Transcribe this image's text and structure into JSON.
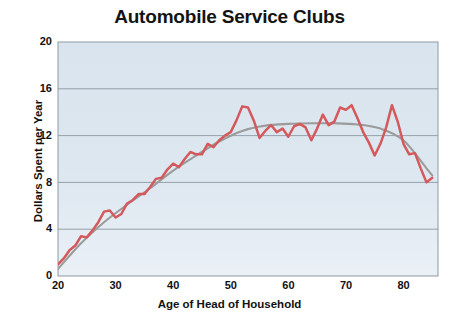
{
  "chart_data": {
    "type": "line",
    "title": "Automobile Service Clubs",
    "xlabel": "Age of Head of Household",
    "ylabel": "Dollars Spent per Year",
    "xlim": [
      20,
      86
    ],
    "ylim": [
      0,
      20
    ],
    "xticks": [
      20,
      30,
      40,
      50,
      60,
      70,
      80
    ],
    "yticks": [
      0,
      4,
      8,
      12,
      16,
      20
    ],
    "grid": true,
    "legend": "none",
    "plot_background_color": "#dce6ef",
    "series": [
      {
        "name": "Dollars spent per year (observed)",
        "color": "#d4595c",
        "style": "jagged-line",
        "x": [
          20,
          21,
          22,
          23,
          24,
          25,
          26,
          27,
          28,
          29,
          30,
          31,
          32,
          33,
          34,
          35,
          36,
          37,
          38,
          39,
          40,
          41,
          42,
          43,
          44,
          45,
          46,
          47,
          48,
          49,
          50,
          51,
          52,
          53,
          54,
          55,
          56,
          57,
          58,
          59,
          60,
          61,
          62,
          63,
          64,
          65,
          66,
          67,
          68,
          69,
          70,
          71,
          72,
          73,
          74,
          75,
          76,
          77,
          78,
          79,
          80,
          81,
          82,
          83,
          84,
          85
        ],
        "values": [
          1.0,
          1.5,
          2.2,
          2.6,
          3.4,
          3.3,
          3.9,
          4.6,
          5.5,
          5.6,
          5.0,
          5.3,
          6.2,
          6.5,
          7.0,
          7.0,
          7.6,
          8.3,
          8.4,
          9.1,
          9.6,
          9.3,
          10.0,
          10.6,
          10.4,
          10.4,
          11.3,
          11.0,
          11.6,
          12.0,
          12.3,
          13.3,
          14.5,
          14.4,
          13.3,
          11.8,
          12.4,
          12.9,
          12.3,
          12.6,
          11.9,
          12.8,
          13.0,
          12.7,
          11.6,
          12.6,
          13.8,
          12.9,
          13.2,
          14.4,
          14.2,
          14.6,
          13.5,
          12.3,
          11.4,
          10.3,
          11.3,
          12.7,
          14.6,
          13.2,
          11.3,
          10.4,
          10.5,
          9.2,
          8.0,
          8.4
        ]
      },
      {
        "name": "Smoothed trend",
        "color": "#9b9b9b",
        "style": "smooth-line",
        "x": [
          20,
          24,
          28,
          32,
          36,
          40,
          44,
          48,
          52,
          56,
          60,
          64,
          68,
          72,
          76,
          80,
          84,
          85
        ],
        "values": [
          0.6,
          2.8,
          4.6,
          6.1,
          7.5,
          9.0,
          10.3,
          11.5,
          12.4,
          12.85,
          13.0,
          13.05,
          13.05,
          12.95,
          12.6,
          11.6,
          9.2,
          8.6
        ]
      }
    ]
  }
}
